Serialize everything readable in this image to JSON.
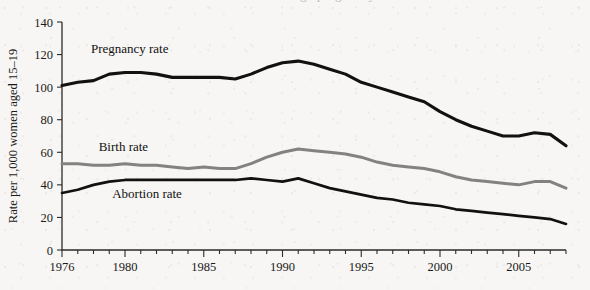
{
  "chart_data": {
    "type": "line",
    "title": "",
    "xlabel": "",
    "ylabel": "Rate per 1,000 women aged 15–19",
    "xlim": [
      1976,
      2008
    ],
    "ylim": [
      0,
      140
    ],
    "yticks": [
      0,
      20,
      40,
      60,
      80,
      100,
      120,
      140
    ],
    "xticks": [
      1976,
      1980,
      1985,
      1990,
      1995,
      2000,
      2005
    ],
    "xtick_labels": [
      "1976",
      "1980",
      "1985",
      "1990",
      "1995",
      "2000",
      "2005"
    ],
    "ytick_labels": [
      "0",
      "20",
      "40",
      "60",
      "80",
      "100",
      "120",
      "140"
    ],
    "minor_xticks_every": 1,
    "grid": false,
    "legend": "inline-annotations",
    "x": [
      1976,
      1977,
      1978,
      1979,
      1980,
      1981,
      1982,
      1983,
      1984,
      1985,
      1986,
      1987,
      1988,
      1989,
      1990,
      1991,
      1992,
      1993,
      1994,
      1995,
      1996,
      1997,
      1998,
      1999,
      2000,
      2001,
      2002,
      2003,
      2004,
      2005,
      2006,
      2007,
      2008
    ],
    "series": [
      {
        "name": "Pregnancy rate",
        "color": "#111111",
        "width": 3.1,
        "values": [
          101,
          103,
          104,
          108,
          109,
          109,
          108,
          106,
          106,
          106,
          106,
          105,
          108,
          112,
          115,
          116,
          114,
          111,
          108,
          103,
          100,
          97,
          94,
          91,
          85,
          80,
          76,
          73,
          70,
          70,
          72,
          71,
          64
        ]
      },
      {
        "name": "Birth rate",
        "color": "#828282",
        "width": 3.0,
        "values": [
          53,
          53,
          52,
          52,
          53,
          52,
          52,
          51,
          50,
          51,
          50,
          50,
          53,
          57,
          60,
          62,
          61,
          60,
          59,
          57,
          54,
          52,
          51,
          50,
          48,
          45,
          43,
          42,
          41,
          40,
          42,
          42,
          38
        ]
      },
      {
        "name": "Abortion rate",
        "color": "#111111",
        "width": 2.7,
        "values": [
          35,
          37,
          40,
          42,
          43,
          43,
          43,
          43,
          43,
          43,
          43,
          43,
          44,
          43,
          42,
          44,
          41,
          38,
          36,
          34,
          32,
          31,
          29,
          28,
          27,
          25,
          24,
          23,
          22,
          21,
          20,
          19,
          16
        ]
      }
    ],
    "annotations": [
      {
        "text": "Pregnancy rate",
        "x": 1980.3,
        "y": 121,
        "anchor": "middle"
      },
      {
        "text": "Birth rate",
        "x": 1979.9,
        "y": 61,
        "anchor": "middle"
      },
      {
        "text": "Abortion rate",
        "x": 1981.4,
        "y": 32,
        "anchor": "middle"
      }
    ]
  },
  "page": {
    "top_cut_fragment": "teenage pregnancy"
  }
}
